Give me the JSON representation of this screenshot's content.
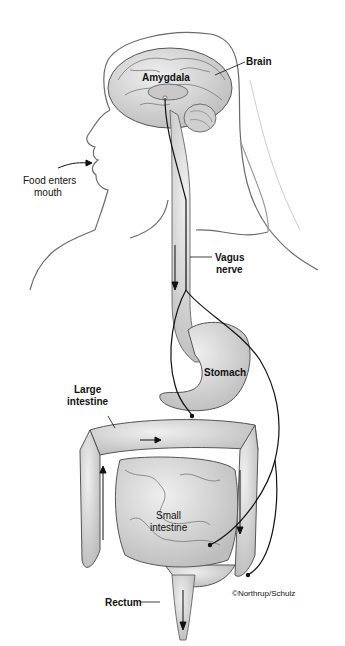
{
  "diagram": {
    "labels": {
      "brain": "Brain",
      "amygdala": "Amygdala",
      "food_line1": "Food enters",
      "food_line2": "mouth",
      "vagus_line1": "Vagus",
      "vagus_line2": "nerve",
      "stomach": "Stomach",
      "large_line1": "Large",
      "large_line2": "intestine",
      "small_line1": "Small",
      "small_line2": "intestine",
      "rectum": "Rectum",
      "credit": "©Northrup/Schulz"
    },
    "colors": {
      "background": "#ffffff",
      "organ_fill": "#d9d9d9",
      "organ_stroke": "#555555",
      "outline": "#666666",
      "nerve": "#111111",
      "text": "#111111"
    }
  }
}
